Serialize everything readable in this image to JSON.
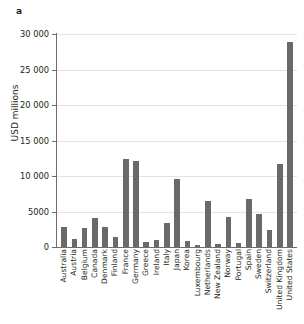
{
  "figure": {
    "panel_label": "a",
    "bar_color": "#6a6a6a",
    "grid_color": "#e3e3e3",
    "axis_color": "#6d6e71",
    "background": "#ffffff"
  },
  "chart_data": {
    "type": "bar",
    "title": "",
    "subtitle": "",
    "xlabel": "",
    "ylabel": "USD millions",
    "ylim": [
      0,
      30000
    ],
    "grid": "horizontal",
    "legend": "none",
    "orientation": "vertical",
    "tick_labels_y": [
      "0",
      "5000",
      "10 000",
      "15 000",
      "20 000",
      "25 000",
      "30 000"
    ],
    "tick_values_y": [
      0,
      5000,
      10000,
      15000,
      20000,
      25000,
      30000
    ],
    "categories": [
      "Australia",
      "Austria",
      "Belgium",
      "Canada",
      "Denmark",
      "Finland",
      "France",
      "Germany",
      "Greece",
      "Ireland",
      "Italy",
      "Japan",
      "Korea",
      "Luxembourg",
      "Netherlands",
      "New Zealand",
      "Norway",
      "Portugal",
      "Spain",
      "Sweden",
      "Switzerland",
      "United Kingdom",
      "United States"
    ],
    "values": [
      2800,
      1150,
      2650,
      4150,
      2850,
      1350,
      12450,
      12050,
      650,
      1050,
      3400,
      9600,
      900,
      350,
      6500,
      400,
      4250,
      500,
      6700,
      4700,
      2450,
      11650,
      28900
    ]
  }
}
